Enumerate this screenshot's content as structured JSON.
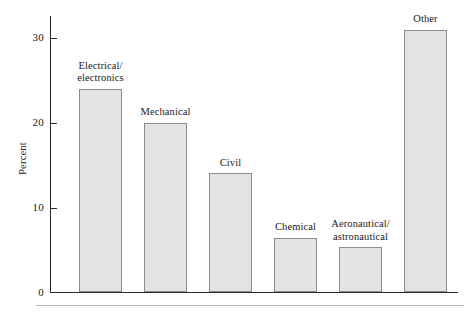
{
  "chart_data": {
    "type": "bar",
    "title": "",
    "subtitle": "",
    "xlabel": "",
    "ylabel": "Percent",
    "ylim": [
      0,
      32
    ],
    "grid": false,
    "legend": false,
    "categories": [
      "Electrical/\nelectronics",
      "Mechanical",
      "Civil",
      "Chemical",
      "Aeronautical/\nastronautical",
      "Other"
    ],
    "values": [
      24,
      20,
      14,
      6.4,
      5.3,
      31
    ],
    "ytick_labels": [
      "0",
      "10",
      "20",
      "30"
    ],
    "ytick_values": [
      0,
      10,
      20,
      30
    ],
    "bar_fill_color": "#e3e3e3",
    "bar_border_color": "#8c8c8c",
    "axis_color": "#2b2b2b"
  },
  "axis": {
    "y_title": "Percent",
    "ticks": [
      {
        "label": "30",
        "value": 30
      },
      {
        "label": "20",
        "value": 20
      },
      {
        "label": "10",
        "value": 10
      },
      {
        "label": "0",
        "value": 0
      }
    ]
  },
  "bars": [
    {
      "label": "Electrical/\nelectronics",
      "value": 24
    },
    {
      "label": "Mechanical",
      "value": 20
    },
    {
      "label": "Civil",
      "value": 14
    },
    {
      "label": "Chemical",
      "value": 6.4
    },
    {
      "label": "Aeronautical/\nastronautical",
      "value": 5.3
    },
    {
      "label": "Other",
      "value": 31
    }
  ]
}
